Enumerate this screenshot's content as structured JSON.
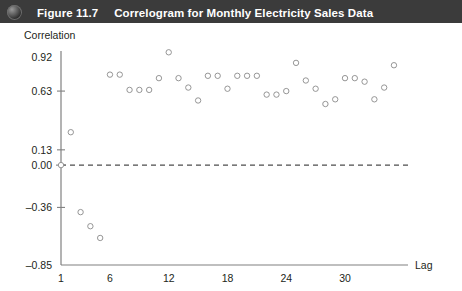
{
  "header": {
    "icon": "sphere-icon",
    "figure_label": "Figure 11.7",
    "title": "Correlogram for Monthly Electricity Sales Data",
    "background_color": "#3b3b3b",
    "text_color": "#ffffff"
  },
  "chart_data": {
    "type": "scatter",
    "title": "Correlogram for Monthly Electricity Sales Data",
    "xlabel": "Lag",
    "ylabel": "Correlation",
    "xlim": [
      0,
      36
    ],
    "ylim": [
      -0.85,
      0.99
    ],
    "grid": false,
    "legend": null,
    "marker": "open-circle",
    "reference_line": {
      "y": 0.0,
      "style": "dashed"
    },
    "xticks": [
      1,
      6,
      12,
      18,
      24,
      30
    ],
    "xtick_labels": [
      "1",
      "6",
      "12",
      "18",
      "24",
      "30"
    ],
    "yticks": [
      0.92,
      0.63,
      0.13,
      0.0,
      -0.36,
      -0.85
    ],
    "ytick_labels": [
      "0.92",
      "0.63",
      "0.13",
      "0.00",
      "-0.36",
      "-0.85"
    ],
    "x": [
      1,
      2,
      3,
      4,
      5,
      6,
      7,
      8,
      9,
      10,
      11,
      12,
      13,
      14,
      15,
      16,
      17,
      18,
      19,
      20,
      21,
      22,
      23,
      24,
      25,
      26,
      27,
      28,
      29,
      30,
      31,
      32,
      33,
      34,
      35
    ],
    "values": [
      0.0,
      0.28,
      -0.4,
      -0.52,
      -0.62,
      0.77,
      0.77,
      0.64,
      0.64,
      0.64,
      0.74,
      0.96,
      0.74,
      0.66,
      0.55,
      0.76,
      0.76,
      0.65,
      0.76,
      0.76,
      0.76,
      0.6,
      0.6,
      0.63,
      0.87,
      0.72,
      0.65,
      0.52,
      0.56,
      0.74,
      0.74,
      0.71,
      0.56,
      0.66,
      0.85
    ],
    "series_name": "Autocorrelation"
  }
}
